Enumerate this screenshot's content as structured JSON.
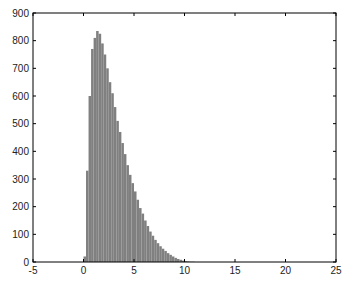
{
  "chart_data": {
    "type": "bar",
    "subtype": "histogram",
    "title": "",
    "xlabel": "",
    "ylabel": "",
    "xlim": [
      -5,
      25
    ],
    "ylim": [
      0,
      900
    ],
    "xticks": [
      -5,
      0,
      5,
      10,
      15,
      20,
      25
    ],
    "yticks": [
      0,
      100,
      200,
      300,
      400,
      500,
      600,
      700,
      800,
      900
    ],
    "grid": false,
    "legend": null,
    "bar_color": "#808080",
    "bin_width": 0.25,
    "bin_starts": [
      0,
      0.25,
      0.5,
      0.75,
      1,
      1.25,
      1.5,
      1.75,
      2,
      2.25,
      2.5,
      2.75,
      3,
      3.25,
      3.5,
      3.75,
      4,
      4.25,
      4.5,
      4.75,
      5,
      5.25,
      5.5,
      5.75,
      6,
      6.25,
      6.5,
      6.75,
      7,
      7.25,
      7.5,
      7.75,
      8,
      8.25,
      8.5,
      8.75,
      9,
      9.25,
      9.5,
      9.75,
      10,
      10.25,
      10.5,
      10.75
    ],
    "values": [
      20,
      330,
      600,
      770,
      810,
      835,
      825,
      790,
      750,
      700,
      650,
      610,
      560,
      510,
      470,
      430,
      390,
      350,
      315,
      285,
      255,
      225,
      195,
      175,
      150,
      130,
      110,
      95,
      80,
      68,
      57,
      48,
      40,
      32,
      26,
      20,
      15,
      11,
      8,
      5,
      3,
      2,
      1,
      1
    ]
  }
}
